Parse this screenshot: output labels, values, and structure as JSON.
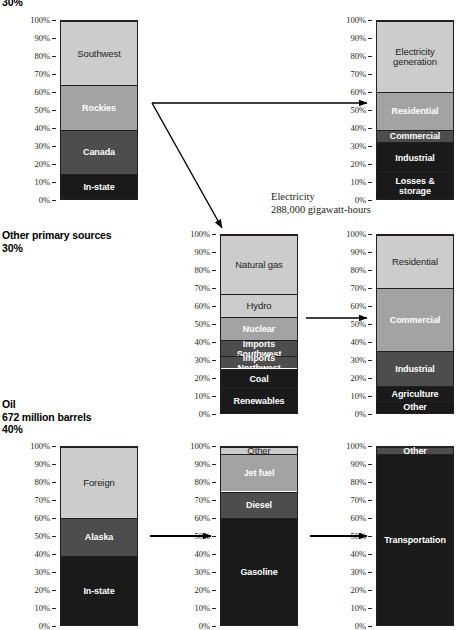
{
  "sections": {
    "electricity": {
      "caption": "30%",
      "note": "Electricity\n288,000 gigawatt-hours"
    },
    "other": {
      "caption": "Other primary sources\n30%"
    },
    "oil": {
      "caption": "Oil\n672 million barrels\n40%"
    }
  },
  "axis": {
    "ticks": [
      "100%",
      "90%",
      "80%",
      "70%",
      "60%",
      "50%",
      "40%",
      "30%",
      "20%",
      "10%",
      "0%"
    ]
  },
  "colors": {
    "light": "#cccccc",
    "mid": "#a3a3a3",
    "dark": "#4d4d4d",
    "black": "#1a1a1a",
    "outline": "#231f20"
  },
  "chart_data": [
    {
      "id": "electricity-sources",
      "type": "bar",
      "title": "Electricity sources",
      "ylabel": "",
      "ylim": [
        0,
        100
      ],
      "categories": [
        "Southwest",
        "Rockies",
        "Canada",
        "In-state"
      ],
      "segments": [
        {
          "label": "Southwest",
          "start": 64,
          "end": 100,
          "value": 36,
          "shade": "light"
        },
        {
          "label": "Rockies",
          "start": 39,
          "end": 64,
          "value": 25,
          "shade": "mid"
        },
        {
          "label": "Canada",
          "start": 14,
          "end": 39,
          "value": 25,
          "shade": "dark"
        },
        {
          "label": "In-state",
          "start": 0,
          "end": 14,
          "value": 14,
          "shade": "black"
        }
      ]
    },
    {
      "id": "electricity-uses",
      "type": "bar",
      "title": "Electricity uses",
      "ylabel": "",
      "ylim": [
        0,
        100
      ],
      "categories": [
        "Electricity generation",
        "Residential",
        "Commercial",
        "Industrial",
        "Losses & storage"
      ],
      "segments": [
        {
          "label": "Electricity\ngeneration",
          "start": 60,
          "end": 100,
          "value": 40,
          "shade": "light"
        },
        {
          "label": "Residential",
          "start": 39,
          "end": 60,
          "value": 21,
          "shade": "mid"
        },
        {
          "label": "Commercial",
          "start": 32,
          "end": 39,
          "value": 7,
          "shade": "dark"
        },
        {
          "label": "Industrial",
          "start": 15,
          "end": 32,
          "value": 17,
          "shade": "black"
        },
        {
          "label": "Losses &\nstorage",
          "start": 0,
          "end": 15,
          "value": 15,
          "shade": "black"
        }
      ]
    },
    {
      "id": "other-primary-sources",
      "type": "bar",
      "title": "Other primary sources",
      "ylabel": "",
      "ylim": [
        0,
        100
      ],
      "categories": [
        "Natural gas",
        "Hydro",
        "Nuclear",
        "Imports Southwest",
        "Imports Northwest",
        "Coal",
        "Renewables"
      ],
      "segments": [
        {
          "label": "Natural gas",
          "start": 67,
          "end": 100,
          "value": 33,
          "shade": "light"
        },
        {
          "label": "Hydro",
          "start": 54,
          "end": 67,
          "value": 13,
          "shade": "light"
        },
        {
          "label": "Nuclear",
          "start": 41,
          "end": 54,
          "value": 13,
          "shade": "mid"
        },
        {
          "label": "Imports Southwest",
          "start": 32,
          "end": 41,
          "value": 9,
          "shade": "dark"
        },
        {
          "label": "Imports Northwest",
          "start": 25,
          "end": 32,
          "value": 7,
          "shade": "dark"
        },
        {
          "label": "Coal",
          "start": 14,
          "end": 25,
          "value": 11,
          "shade": "black"
        },
        {
          "label": "Renewables",
          "start": 0,
          "end": 14,
          "value": 14,
          "shade": "black"
        }
      ]
    },
    {
      "id": "other-primary-uses",
      "type": "bar",
      "title": "Other primary source uses",
      "ylabel": "",
      "ylim": [
        0,
        100
      ],
      "categories": [
        "Residential",
        "Commercial",
        "Industrial",
        "Agriculture",
        "Other"
      ],
      "segments": [
        {
          "label": "Residential",
          "start": 70,
          "end": 100,
          "value": 30,
          "shade": "light"
        },
        {
          "label": "Commercial",
          "start": 35,
          "end": 70,
          "value": 35,
          "shade": "mid"
        },
        {
          "label": "Industrial",
          "start": 15,
          "end": 35,
          "value": 20,
          "shade": "dark"
        },
        {
          "label": "Agriculture",
          "start": 7,
          "end": 15,
          "value": 8,
          "shade": "black"
        },
        {
          "label": "Other",
          "start": 0,
          "end": 7,
          "value": 7,
          "shade": "black"
        }
      ]
    },
    {
      "id": "oil-sources",
      "type": "bar",
      "title": "Oil sources",
      "ylabel": "",
      "ylim": [
        0,
        100
      ],
      "categories": [
        "Foreign",
        "Alaska",
        "In-state"
      ],
      "segments": [
        {
          "label": "Foreign",
          "start": 60,
          "end": 100,
          "value": 40,
          "shade": "light"
        },
        {
          "label": "Alaska",
          "start": 39,
          "end": 60,
          "value": 21,
          "shade": "dark"
        },
        {
          "label": "In-state",
          "start": 0,
          "end": 39,
          "value": 39,
          "shade": "black"
        }
      ]
    },
    {
      "id": "oil-products",
      "type": "bar",
      "title": "Oil products",
      "ylabel": "",
      "ylim": [
        0,
        100
      ],
      "categories": [
        "Other",
        "Jet fuel",
        "Diesel",
        "Gasoline"
      ],
      "segments": [
        {
          "label": "Other",
          "start": 96,
          "end": 100,
          "value": 4,
          "shade": "light"
        },
        {
          "label": "Jet fuel",
          "start": 75,
          "end": 96,
          "value": 21,
          "shade": "mid"
        },
        {
          "label": "Diesel",
          "start": 60,
          "end": 75,
          "value": 15,
          "shade": "dark"
        },
        {
          "label": "Gasoline",
          "start": 0,
          "end": 60,
          "value": 60,
          "shade": "black"
        }
      ]
    },
    {
      "id": "oil-uses",
      "type": "bar",
      "title": "Oil uses",
      "ylabel": "",
      "ylim": [
        0,
        100
      ],
      "categories": [
        "Other",
        "Transportation"
      ],
      "segments": [
        {
          "label": "Other",
          "start": 96,
          "end": 100,
          "value": 4,
          "shade": "dark"
        },
        {
          "label": "Transportation",
          "start": 0,
          "end": 96,
          "value": 96,
          "shade": "black"
        }
      ]
    }
  ]
}
